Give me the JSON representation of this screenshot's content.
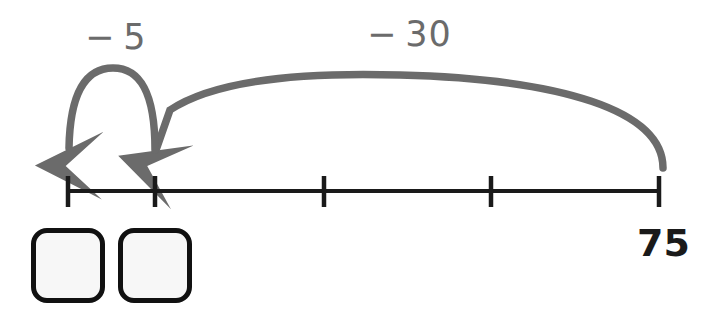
{
  "diagram": {
    "type": "number-line-jumps",
    "background_color": "#ffffff",
    "number_line": {
      "color": "#1a1a1a",
      "y": 191,
      "x_start": 68,
      "x_end": 659,
      "tick_count": 5,
      "tick_positions_px": [
        68,
        155,
        324,
        491,
        659
      ],
      "tick_height_px": 31,
      "labels": [
        {
          "name": "right-endpoint",
          "text": "75",
          "tick_index": 4
        }
      ]
    },
    "jumps": [
      {
        "name": "jump-minus-5",
        "label": "− 5",
        "value": -5,
        "color": "#6b6b6b",
        "from_tick": 1,
        "to_tick": 0,
        "arrowhead": true,
        "direction": "left"
      },
      {
        "name": "jump-minus-30",
        "label": "− 30",
        "value": -30,
        "color": "#6b6b6b",
        "from_tick": 4,
        "to_tick": 1,
        "arrowhead": true,
        "direction": "left"
      }
    ],
    "answer_boxes": [
      {
        "name": "answer-box-1",
        "value": ""
      },
      {
        "name": "answer-box-2",
        "value": ""
      }
    ]
  }
}
